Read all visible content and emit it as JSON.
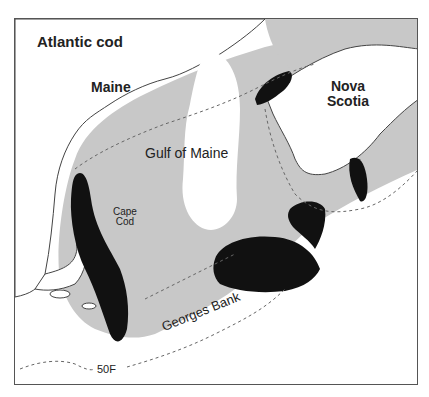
{
  "map": {
    "title": "Atlantic cod",
    "labels": {
      "maine": "Maine",
      "nova_scotia_line1": "Nova",
      "nova_scotia_line2": "Scotia",
      "gulf_of_maine": "Gulf of Maine",
      "cape_cod_line1": "Cape",
      "cape_cod_line2": "Cod",
      "georges_bank": "Georges Bank",
      "isotherm": "50F"
    },
    "legend_semantics": {
      "dark_patches": "concentration areas",
      "gray_shading": "range",
      "dashed_lines": "depth / temperature contours"
    },
    "colors": {
      "range_fill": "#c8c8c8",
      "concentration_fill": "#111111",
      "land_fill": "#ffffff",
      "coastline": "#444444",
      "frame": "#555555",
      "dashed": "#666666"
    }
  }
}
